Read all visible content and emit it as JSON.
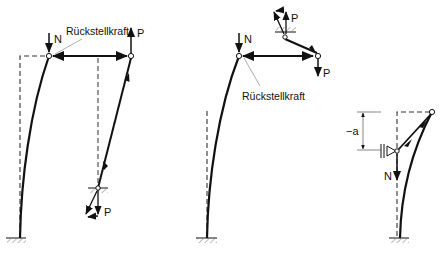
{
  "diagram": {
    "language": "de",
    "figures": [
      {
        "id": "left",
        "labels": {
          "axial_load": "N",
          "load": "P",
          "load_bottom": "P",
          "restoring_force": "Rückstellkraft"
        }
      },
      {
        "id": "middle",
        "labels": {
          "axial_load": "N",
          "load": "P",
          "load_top": "P",
          "restoring_force": "Rückstellkraft"
        }
      },
      {
        "id": "right",
        "labels": {
          "axial_load": "N",
          "dimension": "−a"
        }
      }
    ],
    "colors": {
      "stroke": "#111111",
      "hatch": "#777777",
      "leader": "#888888",
      "background": "#ffffff"
    }
  }
}
